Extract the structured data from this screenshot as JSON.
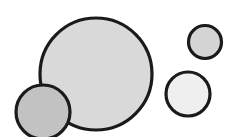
{
  "figure": {
    "background_color": "#ffffff",
    "width": 237,
    "height": 137,
    "outline_color": "#1a1a1a"
  },
  "chart_data": {
    "type": "scatter",
    "subtitle": "",
    "xlabel": "",
    "ylabel": "",
    "xlim": [
      0,
      237
    ],
    "ylim": [
      0,
      137
    ],
    "grid": false,
    "legend": "none",
    "annotations": [],
    "tick_labels": {
      "x": [],
      "y": []
    },
    "series": [
      {
        "name": "circles",
        "marker": "circle",
        "points": [
          {
            "id": "large-circle",
            "label": "Large center circle",
            "cx": 96,
            "cy": 74,
            "r": 56,
            "fill": "#d9d9d9",
            "stroke": "#1a1a1a",
            "stroke_width": 3.2,
            "z": 1
          },
          {
            "id": "bottom-left-circle",
            "label": "Small dark circle bottom left",
            "cx": 43,
            "cy": 112,
            "r": 27,
            "fill": "#c2c2c2",
            "stroke": "#1a1a1a",
            "stroke_width": 3.2,
            "z": 2
          },
          {
            "id": "top-right-circle",
            "label": "Small circle top right",
            "cx": 205,
            "cy": 42,
            "r": 16.5,
            "fill": "#d4d4d4",
            "stroke": "#1a1a1a",
            "stroke_width": 3.2,
            "z": 3
          },
          {
            "id": "mid-right-circle",
            "label": "Medium pale circle right",
            "cx": 188,
            "cy": 94,
            "r": 22,
            "fill": "#efefef",
            "stroke": "#1a1a1a",
            "stroke_width": 3.2,
            "z": 4
          }
        ]
      }
    ]
  }
}
